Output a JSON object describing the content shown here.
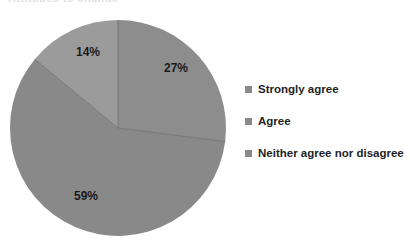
{
  "title_remnant": "Attitudes to change",
  "colors": {
    "background": "#ffffff",
    "slice_strongly_agree": "#8d8d8d",
    "slice_agree": "#898989",
    "slice_neither": "#9b9b9b",
    "legend_swatch": "#8a8a8a",
    "label_text": "#1b1b1b",
    "legend_text": "#1f1f1f",
    "slice_divider": "#6f6f6f"
  },
  "legend": {
    "position": "right",
    "items": [
      {
        "marker": "square-swatch-icon",
        "label": "Strongly agree",
        "color": "#8a8a8a"
      },
      {
        "marker": "square-swatch-icon",
        "label": "Agree",
        "color": "#8a8a8a"
      },
      {
        "marker": "square-swatch-icon",
        "label": "Neither agree nor disagree",
        "color": "#8a8a8a"
      }
    ]
  },
  "labels": {
    "strongly_agree": "27%",
    "agree": "59%",
    "neither": "14%"
  },
  "chart_data": {
    "type": "pie",
    "title": "",
    "xlabel": "",
    "ylabel": "",
    "grid": false,
    "legend_position": "right",
    "categories": [
      "Strongly agree",
      "Agree",
      "Neither agree nor disagree"
    ],
    "values": [
      27,
      59,
      14
    ],
    "data_labels": [
      "27%",
      "59%",
      "14%"
    ],
    "units": "percent",
    "total": 100,
    "start_angle_deg": 0,
    "direction": "clockwise",
    "colors": [
      "#8d8d8d",
      "#898989",
      "#9b9b9b"
    ],
    "series": [
      {
        "name": "Response share",
        "values": [
          27,
          59,
          14
        ]
      }
    ]
  },
  "geometry": {
    "center_x": 118,
    "center_y": 128,
    "radius": 108,
    "label_27_x": 176,
    "label_27_y": 72,
    "label_59_x": 86,
    "label_59_y": 200,
    "label_14_x": 88,
    "label_14_y": 56
  }
}
